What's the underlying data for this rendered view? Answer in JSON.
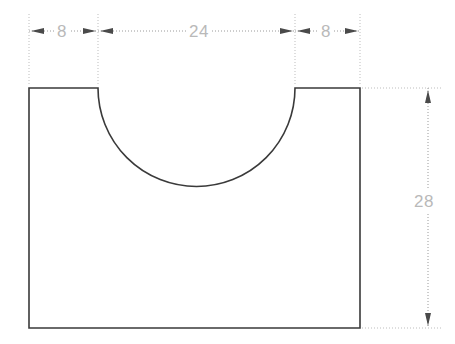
{
  "drawing": {
    "title": "Semicircular notch profile",
    "units": "mm",
    "colors": {
      "outline": "#3a3a3a",
      "dimension_line": "#9a9a9a",
      "extension_line": "#bdbdbd",
      "dimension_text": "#b9b9b9",
      "background": "#ffffff"
    },
    "dimensions": {
      "left_flange": "8",
      "notch_width": "24",
      "right_flange": "8",
      "overall_height": "28"
    },
    "geometry": {
      "overall_width": "40",
      "notch_radius": "12",
      "outline_shape": "rectangle-with-semicircular-top-notch"
    }
  }
}
